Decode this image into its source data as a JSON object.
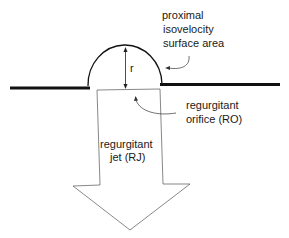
{
  "diagram": {
    "labels": {
      "pisa": [
        "proximal",
        "isovelocity",
        "surface area"
      ],
      "radius": "r",
      "orifice": [
        "regurgitant",
        "orifice (RO)"
      ],
      "jet": [
        "regurgitant",
        "jet (RJ)"
      ]
    },
    "colors": {
      "line": "#111111",
      "thin_line": "#444444",
      "background": "#ffffff"
    }
  }
}
